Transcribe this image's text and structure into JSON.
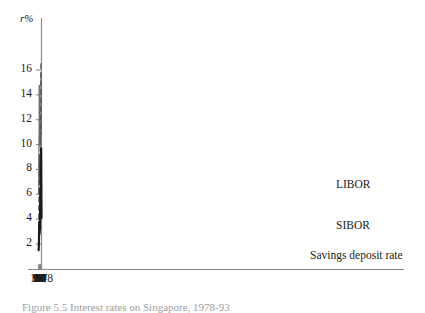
{
  "figure": {
    "caption": "Figure 5.5  Interest rates on Singapore, 1978-93",
    "background": "#ffffff"
  },
  "axes": {
    "y_axis_title": "r%",
    "y_ticks": [
      2,
      4,
      6,
      8,
      10,
      12,
      14,
      16
    ],
    "x_ticks": [
      "1978",
      "80",
      "82",
      "84",
      "86",
      "88",
      "90",
      "92",
      "93"
    ],
    "axis_color": "#8a8a8a"
  },
  "legend": {
    "libor": "LIBOR",
    "sibor": "SIBOR",
    "savings": "Savings deposit rate"
  },
  "chart_data": {
    "type": "line",
    "title": "",
    "subtitle": "",
    "xlabel": "",
    "ylabel": "r%",
    "ylim": [
      0,
      17.5
    ],
    "xlim": [
      1978,
      93
    ],
    "grid": false,
    "legend_position": "right-inline",
    "x": [
      1978,
      1979,
      1980,
      1981,
      1982,
      1983,
      1984,
      1985,
      1986,
      1987,
      1988,
      1989,
      1990,
      1991,
      1992,
      1993
    ],
    "xtick_values": [
      1978,
      1980,
      1982,
      1984,
      1986,
      1988,
      1990,
      1992,
      1993
    ],
    "xtick_labels": [
      "1978",
      "80",
      "82",
      "84",
      "86",
      "88",
      "90",
      "92",
      "93"
    ],
    "ytick_values": [
      2,
      4,
      6,
      8,
      10,
      12,
      14,
      16
    ],
    "series": [
      {
        "name": "LIBOR",
        "style": "solid",
        "color": "#6e6e6e",
        "width": 1.0,
        "x": [
          1978,
          1979,
          1980,
          1981,
          1982,
          1983,
          1984,
          1985,
          1986,
          1987,
          1988,
          1989,
          1990,
          1991,
          1992,
          1993
        ],
        "values": [
          10.9,
          13.9,
          15.8,
          14.2,
          12.4,
          10.0,
          10.0,
          11.9,
          10.5,
          9.9,
          10.5,
          13.8,
          14.8,
          11.2,
          9.8,
          6.0
        ]
      },
      {
        "name": "SIBOR",
        "style": "dashed",
        "color": "#555555",
        "width": 1.2,
        "x": [
          1981,
          1982,
          1983,
          1984,
          1985,
          1986,
          1987,
          1988,
          1989,
          1990,
          1991,
          1992,
          1993
        ],
        "values": [
          16.5,
          13.0,
          10.0,
          10.8,
          9.4,
          6.8,
          7.4,
          8.1,
          9.2,
          8.2,
          6.0,
          4.3,
          3.3
        ]
      },
      {
        "name": "Savings deposit rate",
        "style": "solid",
        "color": "#1a1a1a",
        "width": 2.2,
        "x": [
          1978,
          1979,
          1980,
          1981,
          1982,
          1983,
          1984,
          1985,
          1986,
          1987,
          1988,
          1989,
          1990,
          1991,
          1992,
          1993
        ],
        "values": [
          4.1,
          6.9,
          9.7,
          8.4,
          6.4,
          6.3,
          6.5,
          5.2,
          3.2,
          3.1,
          2.8,
          3.8,
          3.4,
          2.4,
          1.8,
          1.5
        ]
      }
    ]
  }
}
